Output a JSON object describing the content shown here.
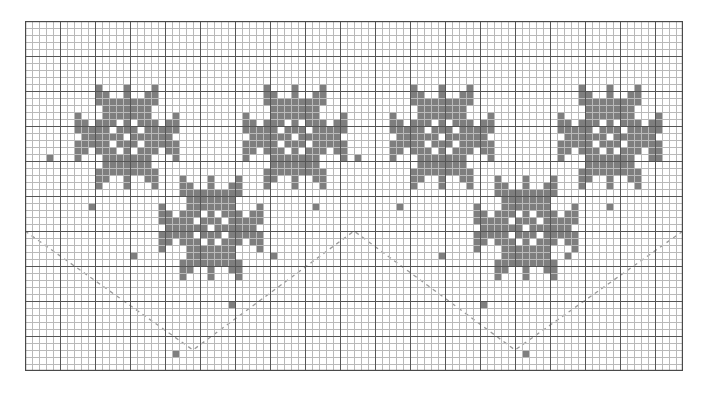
{
  "document": {
    "title": "Cross-Stitch Star Border Chart",
    "type": "pattern-chart"
  },
  "chart_data": {
    "type": "heatmap",
    "xlabel": "",
    "ylabel": "",
    "grid": true,
    "legend_position": "none",
    "cols": 94,
    "rows": 50,
    "cell_px": 7,
    "origin_x": 25,
    "origin_y": 21,
    "colors": {
      "background": "#ffffff",
      "fill": "#7e7e7e",
      "minor_grid": "#b9b9b9",
      "major_grid": "#555555",
      "border": "#4a4a4a",
      "guide_line": "#9a9a9a"
    },
    "major_grid_every": 5,
    "star_motif": {
      "name": "eight-point-star",
      "size": 15,
      "cells": [
        [
          3,
          0
        ],
        [
          7,
          0
        ],
        [
          11,
          0
        ],
        [
          3,
          1
        ],
        [
          4,
          1
        ],
        [
          7,
          1
        ],
        [
          10,
          1
        ],
        [
          11,
          1
        ],
        [
          3,
          2
        ],
        [
          4,
          2
        ],
        [
          5,
          2
        ],
        [
          6,
          2
        ],
        [
          7,
          2
        ],
        [
          8,
          2
        ],
        [
          9,
          2
        ],
        [
          10,
          2
        ],
        [
          11,
          2
        ],
        [
          4,
          3
        ],
        [
          5,
          3
        ],
        [
          6,
          3
        ],
        [
          7,
          3
        ],
        [
          8,
          3
        ],
        [
          9,
          3
        ],
        [
          10,
          3
        ],
        [
          0,
          4
        ],
        [
          4,
          4
        ],
        [
          5,
          4
        ],
        [
          6,
          4
        ],
        [
          7,
          4
        ],
        [
          8,
          4
        ],
        [
          9,
          4
        ],
        [
          10,
          4
        ],
        [
          14,
          4
        ],
        [
          0,
          5
        ],
        [
          1,
          5
        ],
        [
          3,
          5
        ],
        [
          4,
          5
        ],
        [
          5,
          5
        ],
        [
          7,
          5
        ],
        [
          9,
          5
        ],
        [
          10,
          5
        ],
        [
          11,
          5
        ],
        [
          13,
          5
        ],
        [
          14,
          5
        ],
        [
          0,
          6
        ],
        [
          1,
          6
        ],
        [
          2,
          6
        ],
        [
          3,
          6
        ],
        [
          4,
          6
        ],
        [
          6,
          6
        ],
        [
          7,
          6
        ],
        [
          8,
          6
        ],
        [
          10,
          6
        ],
        [
          11,
          6
        ],
        [
          12,
          6
        ],
        [
          13,
          6
        ],
        [
          14,
          6
        ],
        [
          1,
          7
        ],
        [
          2,
          7
        ],
        [
          3,
          7
        ],
        [
          4,
          7
        ],
        [
          5,
          7
        ],
        [
          6,
          7
        ],
        [
          8,
          7
        ],
        [
          9,
          7
        ],
        [
          10,
          7
        ],
        [
          11,
          7
        ],
        [
          12,
          7
        ],
        [
          13,
          7
        ],
        [
          0,
          8
        ],
        [
          1,
          8
        ],
        [
          2,
          8
        ],
        [
          3,
          8
        ],
        [
          4,
          8
        ],
        [
          6,
          8
        ],
        [
          7,
          8
        ],
        [
          8,
          8
        ],
        [
          10,
          8
        ],
        [
          11,
          8
        ],
        [
          12,
          8
        ],
        [
          13,
          8
        ],
        [
          14,
          8
        ],
        [
          0,
          9
        ],
        [
          1,
          9
        ],
        [
          3,
          9
        ],
        [
          4,
          9
        ],
        [
          5,
          9
        ],
        [
          7,
          9
        ],
        [
          9,
          9
        ],
        [
          10,
          9
        ],
        [
          11,
          9
        ],
        [
          13,
          9
        ],
        [
          14,
          9
        ],
        [
          0,
          10
        ],
        [
          4,
          10
        ],
        [
          5,
          10
        ],
        [
          6,
          10
        ],
        [
          7,
          10
        ],
        [
          8,
          10
        ],
        [
          9,
          10
        ],
        [
          10,
          10
        ],
        [
          14,
          10
        ],
        [
          4,
          11
        ],
        [
          5,
          11
        ],
        [
          6,
          11
        ],
        [
          7,
          11
        ],
        [
          8,
          11
        ],
        [
          9,
          11
        ],
        [
          10,
          11
        ],
        [
          3,
          12
        ],
        [
          4,
          12
        ],
        [
          5,
          12
        ],
        [
          6,
          12
        ],
        [
          7,
          12
        ],
        [
          8,
          12
        ],
        [
          9,
          12
        ],
        [
          10,
          12
        ],
        [
          11,
          12
        ],
        [
          3,
          13
        ],
        [
          4,
          13
        ],
        [
          7,
          13
        ],
        [
          10,
          13
        ],
        [
          11,
          13
        ],
        [
          3,
          14
        ],
        [
          7,
          14
        ],
        [
          11,
          14
        ]
      ]
    },
    "star_placements": [
      {
        "col": 7,
        "row": 9,
        "label": "star-upper-left-1"
      },
      {
        "col": 31,
        "row": 9,
        "label": "star-upper-left-2"
      },
      {
        "col": 19,
        "row": 22,
        "label": "star-lower-left"
      },
      {
        "col": 52,
        "row": 9,
        "label": "star-upper-right-1"
      },
      {
        "col": 76,
        "row": 9,
        "label": "star-upper-right-2"
      },
      {
        "col": 64,
        "row": 22,
        "label": "star-lower-right"
      }
    ],
    "isolated_squares": [
      {
        "col": 47,
        "row": 19
      },
      {
        "col": 89,
        "row": 19
      },
      {
        "col": 3,
        "row": 19
      },
      {
        "col": 41,
        "row": 26
      },
      {
        "col": 53,
        "row": 26
      },
      {
        "col": 9,
        "row": 26
      },
      {
        "col": 83,
        "row": 26
      },
      {
        "col": 35,
        "row": 33
      },
      {
        "col": 59,
        "row": 33
      },
      {
        "col": 15,
        "row": 33
      },
      {
        "col": 77,
        "row": 33
      },
      {
        "col": 29,
        "row": 40
      },
      {
        "col": 65,
        "row": 40
      },
      {
        "col": 21,
        "row": 47
      },
      {
        "col": 71,
        "row": 47
      }
    ],
    "guide_lines": {
      "style": "dashed",
      "description": "chevron guide lines forming V and inverted-V",
      "points": [
        [
          0,
          30
        ],
        [
          24,
          47
        ],
        [
          47,
          30
        ],
        [
          70,
          47
        ],
        [
          94,
          30
        ]
      ]
    }
  }
}
